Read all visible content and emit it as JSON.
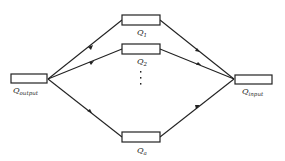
{
  "diagram": {
    "type": "parallel-flow-network",
    "nodes": {
      "output": {
        "label": "Q",
        "subscript": "output"
      },
      "input": {
        "label": "Q",
        "subscript": "input"
      },
      "branch1": {
        "label": "Q",
        "subscript": "1"
      },
      "branch2": {
        "label": "Q",
        "subscript": "2"
      },
      "branchN": {
        "label": "Q",
        "subscript": "a"
      }
    },
    "ellipsis": "⋮",
    "edge_direction": "input → branches → output"
  }
}
